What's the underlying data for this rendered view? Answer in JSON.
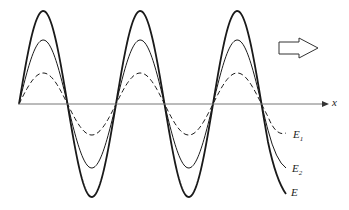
{
  "diagram": {
    "axis_label": "x",
    "direction_arrow": "propagation-direction",
    "waves": [
      {
        "name": "E1",
        "label": "E",
        "subscript": "1",
        "style": "dashed",
        "amplitude_px": 31
      },
      {
        "name": "E2",
        "label": "E",
        "subscript": "2",
        "style": "thin-solid",
        "amplitude_px": 64
      },
      {
        "name": "E",
        "label": "E",
        "subscript": "",
        "style": "thick-solid",
        "amplitude_px": 93
      }
    ],
    "colors": {
      "line": "#1a1a1a",
      "axis": "#777777"
    }
  }
}
